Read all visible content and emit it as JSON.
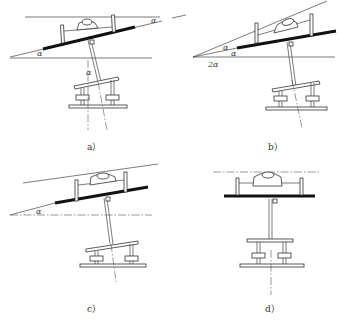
{
  "figure": {
    "panels": [
      {
        "id": "a",
        "label": "a）",
        "angle_labels": [
          "α",
          "α",
          "α"
        ]
      },
      {
        "id": "b",
        "label": "b）",
        "angle_labels": [
          "α",
          "α",
          "2α"
        ]
      },
      {
        "id": "c",
        "label": "c）",
        "angle_labels": [
          "α"
        ]
      },
      {
        "id": "d",
        "label": "d）",
        "angle_labels": []
      }
    ]
  },
  "colors": {
    "line": "#444444",
    "bar": "#111111",
    "background": "#ffffff"
  }
}
